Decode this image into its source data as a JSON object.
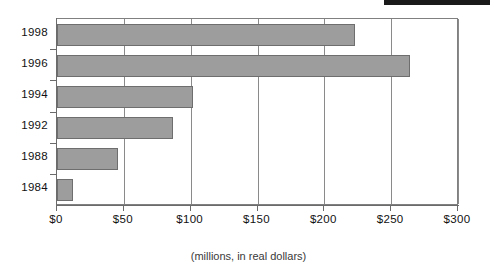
{
  "decorations": {
    "top_black_bar_name": "top-black-redaction-bar"
  },
  "chart_data": {
    "type": "bar",
    "orientation": "horizontal",
    "title": "",
    "subtitle": "",
    "xlabel": "(millions, in real dollars)",
    "ylabel": "",
    "categories": [
      "1998",
      "1996",
      "1994",
      "1992",
      "1988",
      "1984"
    ],
    "values": [
      223,
      264,
      102,
      87,
      46,
      12
    ],
    "series": [
      {
        "name": "Amount",
        "values": [
          223,
          264,
          102,
          87,
          46,
          12
        ]
      }
    ],
    "xlim": [
      0,
      300
    ],
    "xticks": [
      0,
      50,
      100,
      150,
      200,
      250,
      300
    ],
    "xticklabels": [
      "$0",
      "$50",
      "$100",
      "$150",
      "$200",
      "$250",
      "$300"
    ],
    "grid": "vertical",
    "legend": "none",
    "bar_color": "#9d9d9d",
    "bar_border_color": "#6e6e6e",
    "axis_color": "#6b6b6b",
    "gridline_color": "#8a8a8a",
    "text_color": "#111111",
    "caption_color": "#3a3a3a"
  }
}
